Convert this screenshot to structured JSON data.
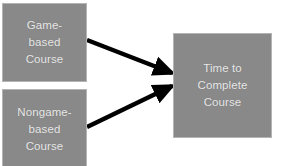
{
  "diagram": {
    "background_color": "#ffffff",
    "node_fill_color": "#898989",
    "node_border_color": "#b4b4b4",
    "node_text_color": "#e8e8e8",
    "edge_color": "#000000",
    "nodes": [
      {
        "id": "game-based",
        "label": "Game-\nbased\nCourse",
        "role": "independent-variable-level"
      },
      {
        "id": "nongame-based",
        "label": "Nongame-\nbased\nCourse",
        "role": "independent-variable-level"
      },
      {
        "id": "time-to-complete",
        "label": "Time to\nComplete\nCourse",
        "role": "dependent-variable"
      }
    ],
    "edges": [
      {
        "id": "edge-game-to-time",
        "from": "game-based",
        "to": "time-to-complete",
        "arrowhead": "filled-triangle"
      },
      {
        "id": "edge-nongame-to-time",
        "from": "nongame-based",
        "to": "time-to-complete",
        "arrowhead": "filled-triangle"
      }
    ]
  }
}
